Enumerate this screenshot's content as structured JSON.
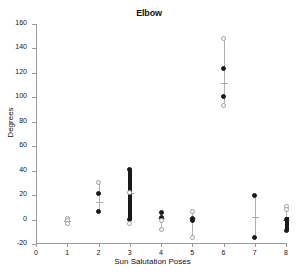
{
  "chart_data": {
    "type": "scatter",
    "title": "Elbow",
    "xlabel": "Sun Salutation Poses",
    "ylabel": "Degrees",
    "xlim": [
      0,
      8
    ],
    "ylim": [
      -20,
      160
    ],
    "xticks": [
      0,
      1,
      2,
      3,
      4,
      5,
      6,
      7,
      8
    ],
    "yticks": [
      -20,
      0,
      20,
      40,
      60,
      80,
      100,
      120,
      140,
      160
    ],
    "grid": false,
    "legend": "none",
    "categories": [
      "1",
      "2",
      "3",
      "4",
      "5",
      "6",
      "7",
      "8"
    ],
    "series": [
      {
        "name": "Pose 1",
        "x": 1,
        "whisker_low": -4,
        "whisker_high": 1,
        "median": -1,
        "markers": [
          {
            "value": 1,
            "color": "grey"
          },
          {
            "value": -1,
            "color": "grey"
          },
          {
            "value": -3,
            "color": "grey"
          }
        ],
        "bar": null
      },
      {
        "name": "Pose 2",
        "x": 2,
        "whisker_low": 6,
        "whisker_high": 30,
        "median": 14,
        "markers": [
          {
            "value": 30,
            "color": "grey"
          },
          {
            "value": 21,
            "color": "black"
          },
          {
            "value": 7,
            "color": "black"
          }
        ],
        "bar": null
      },
      {
        "name": "Pose 3",
        "x": 3,
        "whisker_low": -4,
        "whisker_high": 41,
        "median": 22,
        "markers": [
          {
            "value": 41,
            "color": "black"
          },
          {
            "value": 22,
            "color": "grey"
          },
          {
            "value": 0,
            "color": "black"
          },
          {
            "value": -3,
            "color": "grey"
          }
        ],
        "bar": {
          "low": 0,
          "high": 41
        }
      },
      {
        "name": "Pose 4",
        "x": 4,
        "whisker_low": -8,
        "whisker_high": 6,
        "median": 1,
        "markers": [
          {
            "value": 6,
            "color": "black"
          },
          {
            "value": 2,
            "color": "black"
          },
          {
            "value": -1,
            "color": "grey"
          },
          {
            "value": -8,
            "color": "grey"
          }
        ],
        "bar": null
      },
      {
        "name": "Pose 5",
        "x": 5,
        "whisker_low": -15,
        "whisker_high": 7,
        "median": 1,
        "markers": [
          {
            "value": 7,
            "color": "grey"
          },
          {
            "value": 1,
            "color": "black"
          },
          {
            "value": -1,
            "color": "black"
          },
          {
            "value": -15,
            "color": "grey"
          }
        ],
        "bar": null
      },
      {
        "name": "Pose 6",
        "x": 6,
        "whisker_low": 93,
        "whisker_high": 148,
        "median": 112,
        "markers": [
          {
            "value": 148,
            "color": "grey"
          },
          {
            "value": 124,
            "color": "black"
          },
          {
            "value": 101,
            "color": "black"
          },
          {
            "value": 93,
            "color": "grey"
          }
        ],
        "bar": null
      },
      {
        "name": "Pose 7",
        "x": 7,
        "whisker_low": -15,
        "whisker_high": 20,
        "median": 2,
        "markers": [
          {
            "value": 20,
            "color": "black"
          },
          {
            "value": -15,
            "color": "black"
          }
        ],
        "bar": null
      },
      {
        "name": "Pose 8",
        "x": 8,
        "whisker_low": -9,
        "whisker_high": 11,
        "median": 0,
        "markers": [
          {
            "value": 11,
            "color": "grey"
          },
          {
            "value": 8,
            "color": "grey"
          },
          {
            "value": 0,
            "color": "black"
          },
          {
            "value": -9,
            "color": "black"
          }
        ],
        "bar": {
          "low": -9,
          "high": 2
        }
      }
    ]
  },
  "colors": {
    "axis": "#9a9a9a",
    "marker_black": "#1a1a1a",
    "marker_grey": "#9d9d9d",
    "whisker": "#b0b0b0",
    "text": "#111111",
    "background": "#ffffff"
  }
}
